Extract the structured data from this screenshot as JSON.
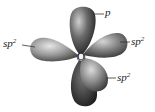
{
  "diagram": {
    "atom": {
      "symbol": "O"
    },
    "labels": [
      {
        "id": "p",
        "base": "p",
        "sup": ""
      },
      {
        "id": "sp2-left",
        "base": "sp",
        "sup": "2"
      },
      {
        "id": "sp2-right",
        "base": "sp",
        "sup": "2"
      },
      {
        "id": "sp2-lower",
        "base": "sp",
        "sup": "2"
      }
    ],
    "colors": {
      "lobe_light": "#d8d8d8",
      "lobe_dark": "#2a2a2a",
      "leader_line": "#333333",
      "background": "#ffffff"
    }
  }
}
